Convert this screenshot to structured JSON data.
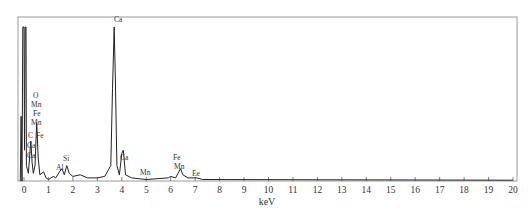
{
  "chart_data": {
    "type": "line",
    "title": "",
    "xlabel": "keV",
    "ylabel": "",
    "xlim": [
      0,
      20
    ],
    "x_ticks": [
      0,
      1,
      2,
      3,
      4,
      5,
      6,
      7,
      8,
      9,
      10,
      11,
      12,
      13,
      14,
      15,
      16,
      17,
      18,
      19,
      20
    ],
    "grid": false,
    "legend": null,
    "series": [
      {
        "name": "EDS spectrum",
        "points": [
          [
            -0.15,
            0.0
          ],
          [
            -0.12,
            0.42
          ],
          [
            -0.08,
            0.0
          ],
          [
            -0.05,
            1.0
          ],
          [
            0.0,
            1.0
          ],
          [
            0.02,
            0.2
          ],
          [
            0.05,
            1.0
          ],
          [
            0.08,
            1.0
          ],
          [
            0.1,
            0.1
          ],
          [
            0.18,
            0.05
          ],
          [
            0.28,
            0.26
          ],
          [
            0.33,
            0.12
          ],
          [
            0.38,
            0.05
          ],
          [
            0.45,
            0.1
          ],
          [
            0.52,
            0.38
          ],
          [
            0.58,
            0.15
          ],
          [
            0.65,
            0.04
          ],
          [
            0.8,
            0.06
          ],
          [
            0.9,
            0.02
          ],
          [
            1.0,
            0.01
          ],
          [
            1.2,
            0.03
          ],
          [
            1.3,
            0.02
          ],
          [
            1.45,
            0.06
          ],
          [
            1.55,
            0.08
          ],
          [
            1.65,
            0.04
          ],
          [
            1.75,
            0.1
          ],
          [
            1.85,
            0.05
          ],
          [
            2.0,
            0.03
          ],
          [
            2.3,
            0.04
          ],
          [
            2.6,
            0.02
          ],
          [
            3.0,
            0.02
          ],
          [
            3.3,
            0.03
          ],
          [
            3.55,
            0.1
          ],
          [
            3.62,
            0.6
          ],
          [
            3.69,
            1.0
          ],
          [
            3.74,
            0.65
          ],
          [
            3.8,
            0.1
          ],
          [
            3.9,
            0.04
          ],
          [
            4.0,
            0.18
          ],
          [
            4.06,
            0.2
          ],
          [
            4.15,
            0.04
          ],
          [
            4.4,
            0.02
          ],
          [
            5.0,
            0.01
          ],
          [
            5.9,
            0.02
          ],
          [
            6.0,
            0.03
          ],
          [
            6.2,
            0.02
          ],
          [
            6.4,
            0.08
          ],
          [
            6.5,
            0.04
          ],
          [
            6.7,
            0.02
          ],
          [
            7.06,
            0.02
          ],
          [
            7.3,
            0.01
          ],
          [
            20.0,
            0.005
          ]
        ]
      }
    ],
    "annotations": [
      {
        "text": "Ca",
        "x": 3.69,
        "position": "top"
      },
      {
        "text": "O",
        "x": 0.52
      },
      {
        "text": "Mn",
        "x": 0.58
      },
      {
        "text": "Fe",
        "x": 0.7
      },
      {
        "text": "Mn",
        "x": 0.58
      },
      {
        "text": "C",
        "x": 0.28
      },
      {
        "text": "Fe",
        "x": 0.72
      },
      {
        "text": "Ca",
        "x": 0.34
      },
      {
        "text": "Ca",
        "x": 0.34
      },
      {
        "text": "Al",
        "x": 1.49
      },
      {
        "text": "Si",
        "x": 1.74
      },
      {
        "text": "Ca",
        "x": 4.01
      },
      {
        "text": "Mn",
        "x": 5.9
      },
      {
        "text": "Fe",
        "x": 6.4
      },
      {
        "text": "Mn",
        "x": 6.49
      },
      {
        "text": "Ee",
        "x": 7.06
      }
    ]
  }
}
